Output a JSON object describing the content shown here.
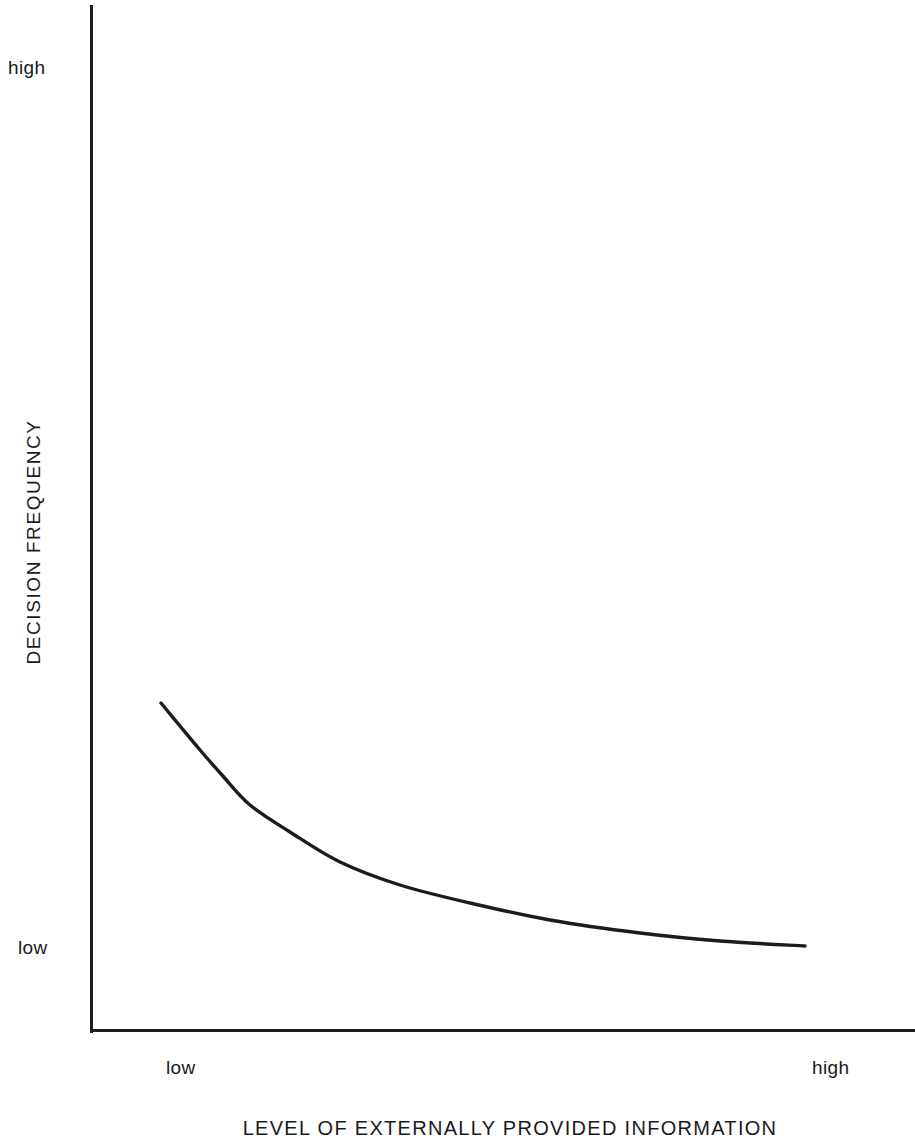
{
  "chart_data": {
    "type": "line",
    "title": "",
    "subtitle": "",
    "xlabel": "LEVEL OF EXTERNALLY PROVIDED INFORMATION",
    "ylabel": "DECISION FREQUENCY",
    "x_tick_labels": [
      "low",
      "high"
    ],
    "y_tick_labels": [
      "low",
      "high"
    ],
    "x_tick_low": "low",
    "x_tick_high": "high",
    "y_tick_low": "low",
    "y_tick_high": "high",
    "xlim": [
      0,
      1
    ],
    "ylim": [
      0,
      1
    ],
    "grid": false,
    "legend": null,
    "annotations": [],
    "series": [
      {
        "name": "decision frequency vs. externally provided information",
        "shape": "monotonically decreasing convex (exponential-decay like)",
        "color": "#1c1c1c",
        "linewidth": 3,
        "x": [
          0.09,
          0.14,
          0.19,
          0.24,
          0.29,
          0.35,
          0.41,
          0.48,
          0.56,
          0.65,
          0.75,
          0.86,
          1.0
        ],
        "y": [
          0.33,
          0.29,
          0.25,
          0.22,
          0.19,
          0.165,
          0.142,
          0.122,
          0.105,
          0.09,
          0.078,
          0.07,
          0.065
        ],
        "points_px": [
          {
            "x": 161,
            "y": 703
          },
          {
            "x": 180,
            "y": 726
          },
          {
            "x": 200,
            "y": 750
          },
          {
            "x": 222,
            "y": 775
          },
          {
            "x": 250,
            "y": 805
          },
          {
            "x": 290,
            "y": 832
          },
          {
            "x": 340,
            "y": 862
          },
          {
            "x": 400,
            "y": 885
          },
          {
            "x": 470,
            "y": 903
          },
          {
            "x": 550,
            "y": 920
          },
          {
            "x": 640,
            "y": 933
          },
          {
            "x": 720,
            "y": 941
          },
          {
            "x": 805,
            "y": 946
          }
        ]
      }
    ]
  },
  "axes": {
    "y_axis_name": "decision-frequency-axis",
    "x_axis_name": "external-information-axis",
    "axis_color": "#1c1c1c"
  },
  "colors": {
    "background": "#ffffff",
    "ink": "#1c1c1c",
    "curve": "#1c1c1c"
  }
}
